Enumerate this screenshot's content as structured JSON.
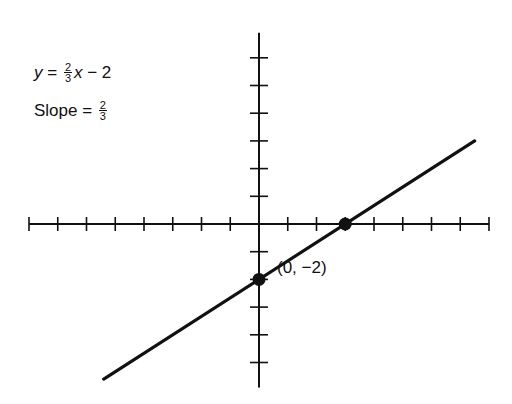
{
  "chart_data": {
    "type": "line",
    "title": "",
    "equation": {
      "lhs": "y",
      "eq": " = ",
      "num": "2",
      "den": "3",
      "var": "x",
      "rest": " − 2"
    },
    "slope_label": {
      "text": "Slope = ",
      "num": "2",
      "den": "3"
    },
    "xlabel": "",
    "ylabel": "",
    "xlim": [
      -8,
      8
    ],
    "ylim": [
      -5.9,
      6.9
    ],
    "x_ticks": [
      -8,
      -7,
      -6,
      -5,
      -4,
      -3,
      -2,
      -1,
      1,
      2,
      3,
      4,
      5,
      6,
      7,
      8
    ],
    "y_ticks": [
      -5,
      -4,
      -3,
      -2,
      -1,
      1,
      2,
      3,
      4,
      5,
      6
    ],
    "grid": false,
    "series": [
      {
        "name": "y = (2/3)x − 2",
        "slope": 0.6667,
        "intercept": -2,
        "x": [
          -5.4,
          7.5
        ],
        "y": [
          -5.6,
          3.0
        ]
      }
    ],
    "points": [
      {
        "x": 0,
        "y": -2,
        "label": "(0, −2)"
      },
      {
        "x": 3,
        "y": 0,
        "label": ""
      }
    ],
    "annotations": [
      "y = (2/3)x − 2",
      "Slope = 2/3",
      "(0, −2)"
    ]
  },
  "labels": {
    "point_label": "(0, −2)"
  }
}
